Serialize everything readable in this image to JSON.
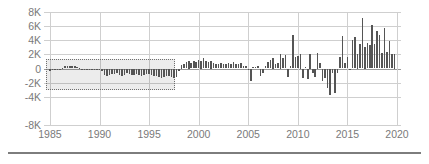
{
  "chart_data": {
    "type": "bar",
    "title": "",
    "subtitle": "",
    "xlabel": "",
    "ylabel": "",
    "grid": true,
    "legend": false,
    "legend_position": "none",
    "bar_color": "#555555",
    "grid_color": "#cfcfcf",
    "axis_text_color": "#7a7a7a",
    "zero_line_color": "#9a9a9a",
    "xlim": [
      1984.4,
      2020.4
    ],
    "ylim": [
      -8000,
      8000
    ],
    "y_ticks": [
      8000,
      6000,
      4000,
      2000,
      0,
      -2000,
      -4000,
      -8000
    ],
    "y_tick_labels": [
      "8K",
      "6K",
      "4K",
      "2K",
      "0",
      "-2K",
      "-4K",
      "-8K"
    ],
    "y_tick_positions_frac": [
      0.0,
      0.125,
      0.25,
      0.375,
      0.5,
      0.625,
      0.75,
      1.0
    ],
    "x_ticks": [
      1985,
      1990,
      1995,
      2000,
      2005,
      2010,
      2015,
      2020
    ],
    "x_tick_labels": [
      "1985",
      "1990",
      "1995",
      "2000",
      "2005",
      "2010",
      "2015",
      "2020"
    ],
    "highlight_region": {
      "label": "selected-range",
      "x_start": 1984.6,
      "x_end": 1997.6,
      "y_top": 1350,
      "y_bottom": -3000,
      "fill": "rgba(0,0,0,0.075)",
      "border_style": "dotted",
      "border_color": "#6e6e6e"
    },
    "x": [
      1985.0,
      1985.25,
      1985.5,
      1985.75,
      1986.0,
      1986.25,
      1986.5,
      1986.75,
      1987.0,
      1987.25,
      1987.5,
      1987.75,
      1988.0,
      1988.25,
      1988.5,
      1988.75,
      1989.0,
      1989.25,
      1989.5,
      1989.75,
      1990.0,
      1990.25,
      1990.5,
      1990.75,
      1991.0,
      1991.25,
      1991.5,
      1991.75,
      1992.0,
      1992.25,
      1992.5,
      1992.75,
      1993.0,
      1993.25,
      1993.5,
      1993.75,
      1994.0,
      1994.25,
      1994.5,
      1994.75,
      1995.0,
      1995.25,
      1995.5,
      1995.75,
      1996.0,
      1996.25,
      1996.5,
      1996.75,
      1997.0,
      1997.25,
      1997.5,
      1997.75,
      1998.0,
      1998.25,
      1998.5,
      1998.75,
      1999.0,
      1999.25,
      1999.5,
      1999.75,
      2000.0,
      2000.25,
      2000.5,
      2000.75,
      2001.0,
      2001.25,
      2001.5,
      2001.75,
      2002.0,
      2002.25,
      2002.5,
      2002.75,
      2003.0,
      2003.25,
      2003.5,
      2003.75,
      2004.0,
      2004.25,
      2004.5,
      2004.75,
      2005.0,
      2005.25,
      2005.5,
      2005.75,
      2006.0,
      2006.25,
      2006.5,
      2006.75,
      2007.0,
      2007.25,
      2007.5,
      2007.75,
      2008.0,
      2008.25,
      2008.5,
      2008.75,
      2009.0,
      2009.25,
      2009.5,
      2009.75,
      2010.0,
      2010.25,
      2010.5,
      2010.75,
      2011.0,
      2011.25,
      2011.5,
      2011.75,
      2012.0,
      2012.25,
      2012.5,
      2012.75,
      2013.0,
      2013.25,
      2013.5,
      2013.75,
      2014.0,
      2014.25,
      2014.5,
      2014.75,
      2015.0,
      2015.25,
      2015.5,
      2015.75,
      2016.0,
      2016.25,
      2016.5,
      2016.75,
      2017.0,
      2017.25,
      2017.5,
      2017.75,
      2018.0,
      2018.25,
      2018.5,
      2018.75,
      2019.0,
      2019.25,
      2019.5,
      2019.75
    ],
    "values": [
      -300,
      -280,
      -250,
      -200,
      -120,
      120,
      300,
      380,
      420,
      400,
      300,
      180,
      60,
      -80,
      -140,
      -200,
      -240,
      -260,
      -220,
      -200,
      -260,
      -300,
      -850,
      -1000,
      -900,
      -820,
      -760,
      -700,
      -900,
      -1000,
      -950,
      -700,
      -800,
      -900,
      -850,
      -780,
      -950,
      -1000,
      -900,
      -820,
      -760,
      -900,
      -1000,
      -1100,
      -1200,
      -1300,
      -1150,
      -1000,
      -1100,
      -1250,
      -1300,
      -1150,
      -300,
      500,
      700,
      900,
      1000,
      800,
      1100,
      900,
      1200,
      1000,
      1550,
      1100,
      900,
      1000,
      800,
      700,
      600,
      800,
      700,
      600,
      800,
      700,
      900,
      700,
      600,
      800,
      400,
      300,
      -200,
      -1700,
      200,
      150,
      300,
      -1050,
      -700,
      300,
      900,
      1200,
      1500,
      600,
      800,
      2000,
      1450,
      1900,
      -1250,
      400,
      4700,
      1600,
      1800,
      2000,
      -1400,
      200,
      -1450,
      2000,
      -700,
      -1150,
      2250,
      800,
      -1750,
      -1300,
      -2700,
      -3750,
      -700,
      -3500,
      -600,
      1600,
      4600,
      800,
      1650,
      -200,
      4100,
      4400,
      2000,
      3450,
      7150,
      3000,
      3550,
      3300,
      6100,
      3400,
      5300,
      4800,
      2200,
      5700,
      2400,
      3950,
      2100,
      2000
    ]
  }
}
